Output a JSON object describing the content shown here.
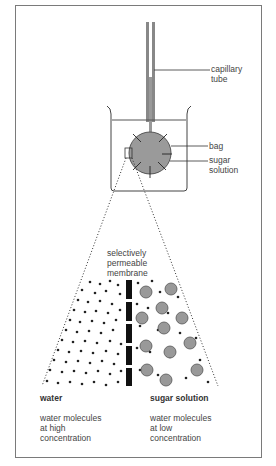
{
  "diagram": {
    "labels": {
      "capillary_tube": "capillary\ntube",
      "bag": "bag",
      "sugar_solution_beaker": "sugar\nsolution",
      "membrane": "selectively\npermeable\nmembrane",
      "water_heading": "water",
      "water_desc": "water molecules\nat high\nconcentration",
      "sugar_heading": "sugar solution",
      "sugar_desc": "water molecules\nat low\nconcentration"
    },
    "colors": {
      "frame": "#7a7a7a",
      "line": "#333333",
      "bag_fill": "#9a9a9a",
      "sugar_molecule": "#999999",
      "membrane": "#111111",
      "water_dot": "#222222"
    }
  }
}
